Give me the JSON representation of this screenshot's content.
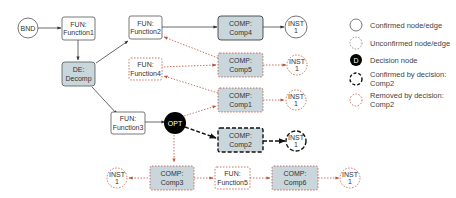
{
  "colors": {
    "confirmed_stroke": "#555555",
    "removed_stroke": "#c0503a",
    "comp_fill": "#c9d6dc",
    "decision_fill": "#000000",
    "confirmed_by_decision_stroke": "#222222"
  },
  "nodes": {
    "bnd": {
      "line1": "BND",
      "line2": ""
    },
    "function1": {
      "line1": "FUN:",
      "line2": "Function1"
    },
    "decomp": {
      "line1": "DE:",
      "line2": "Decomp"
    },
    "function2": {
      "line1": "FUN:",
      "line2": "Function2"
    },
    "function4": {
      "line1": "FUN:",
      "line2": "Function4"
    },
    "function3": {
      "line1": "FUN:",
      "line2": "Function3"
    },
    "opt": {
      "line1": "OPT",
      "line2": ""
    },
    "comp4": {
      "line1": "COMP:",
      "line2": "Comp4"
    },
    "comp5": {
      "line1": "COMP:",
      "line2": "Comp5"
    },
    "comp1": {
      "line1": "COMP:",
      "line2": "Comp1"
    },
    "comp2": {
      "line1": "COMP:",
      "line2": "Comp2"
    },
    "comp3": {
      "line1": "COMP:",
      "line2": "Comp3"
    },
    "function5": {
      "line1": "FUN:",
      "line2": "Function5"
    },
    "comp6": {
      "line1": "COMP:",
      "line2": "Comp6"
    },
    "inst_comp4": {
      "line1": "INST",
      "line2": "1"
    },
    "inst_comp5": {
      "line1": "INST",
      "line2": "1"
    },
    "inst_comp1": {
      "line1": "INST",
      "line2": "1"
    },
    "inst_comp2": {
      "line1": "INST",
      "line2": "1"
    },
    "inst_comp3": {
      "line1": "INST",
      "line2": "1"
    },
    "inst_comp6": {
      "line1": "INST",
      "line2": "1"
    }
  },
  "legend": [
    {
      "kind": "confirmed",
      "line1": "Confirmed node/edge",
      "line2": ""
    },
    {
      "kind": "unconfirmed",
      "line1": "Unconfirmed node/edge",
      "line2": ""
    },
    {
      "kind": "decision",
      "glyph": "D",
      "line1": "Decision node",
      "line2": ""
    },
    {
      "kind": "confirmed-by-decision",
      "line1": "Confirmed by decision:",
      "line2": "Comp2"
    },
    {
      "kind": "removed-by-decision",
      "line1": "Removed by decision:",
      "line2": "Comp2"
    }
  ]
}
